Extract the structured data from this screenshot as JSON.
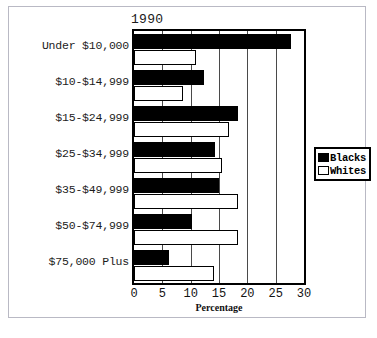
{
  "chart_data": {
    "type": "bar",
    "orientation": "horizontal",
    "title": "1990",
    "xlabel": "Percentage",
    "ylabel": "",
    "xlim": [
      0,
      30
    ],
    "xticks": [
      0,
      5,
      10,
      15,
      20,
      25,
      30
    ],
    "grid": true,
    "legend_position": "right",
    "categories": [
      "Under $10,000",
      "$10-$14,999",
      "$15-$24,999",
      "$25-$34,999",
      "$35-$49,999",
      "$50-$74,999",
      "$75,000 Plus"
    ],
    "series": [
      {
        "name": "Blacks",
        "color": "#000000",
        "values": [
          27.7,
          12.3,
          18.3,
          14.3,
          15.0,
          10.2,
          6.2
        ]
      },
      {
        "name": "Whites",
        "color": "#ffffff",
        "values": [
          11.0,
          8.7,
          16.7,
          15.5,
          18.4,
          18.4,
          14.1
        ]
      }
    ]
  },
  "legend": {
    "items": [
      {
        "label": "Blacks",
        "swatch": "blacks"
      },
      {
        "label": "Whites",
        "swatch": "whites"
      }
    ]
  }
}
